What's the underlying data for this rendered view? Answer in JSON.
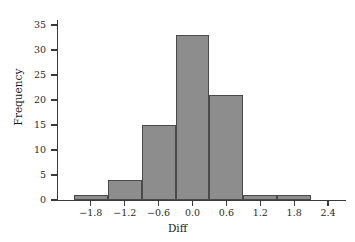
{
  "chart_data": {
    "type": "bar",
    "title": "",
    "subtitle": "",
    "xlabel": "Diff",
    "ylabel": "Frequency",
    "xlim": [
      -2.4,
      2.7
    ],
    "ylim": [
      0,
      35
    ],
    "grid": false,
    "legend": null,
    "bin_width": 0.6,
    "bin_edges": [
      -2.1,
      -1.5,
      -0.9,
      -0.3,
      0.3,
      0.9,
      1.5,
      2.1
    ],
    "categories": [
      "-2.1 to -1.5",
      "-1.5 to -0.9",
      "-0.9 to -0.3",
      "-0.3 to 0.3",
      "0.3 to 0.9",
      "0.9 to 1.5",
      "1.5 to 2.1"
    ],
    "values": [
      1,
      4,
      15,
      33,
      21,
      1,
      1
    ],
    "bars": [
      {
        "x0": -2.1,
        "x1": -1.5,
        "value": 1
      },
      {
        "x0": -1.5,
        "x1": -0.9,
        "value": 4
      },
      {
        "x0": -0.9,
        "x1": -0.3,
        "value": 15
      },
      {
        "x0": -0.3,
        "x1": 0.3,
        "value": 33
      },
      {
        "x0": 0.3,
        "x1": 0.9,
        "value": 21
      },
      {
        "x0": 0.9,
        "x1": 1.5,
        "value": 1
      },
      {
        "x0": 1.5,
        "x1": 2.1,
        "value": 1
      }
    ],
    "xticks": [
      -1.8,
      -1.2,
      -0.6,
      0.0,
      0.6,
      1.2,
      1.8,
      2.4
    ],
    "xtick_labels": [
      "−1.8",
      "−1.2",
      "−0.6",
      "0.0",
      "0.6",
      "1.2",
      "1.8",
      "2.4"
    ],
    "yticks": [
      0,
      5,
      10,
      15,
      20,
      25,
      30,
      35
    ],
    "ytick_labels": [
      "0",
      "5",
      "10",
      "15",
      "20",
      "25",
      "30",
      "35"
    ],
    "colors": {
      "bar_fill": "#8d8d8d",
      "bar_border": "#4a4a4a",
      "axis": "#3a3a3a",
      "text": "#1a1a1a",
      "background": "#ffffff"
    }
  }
}
